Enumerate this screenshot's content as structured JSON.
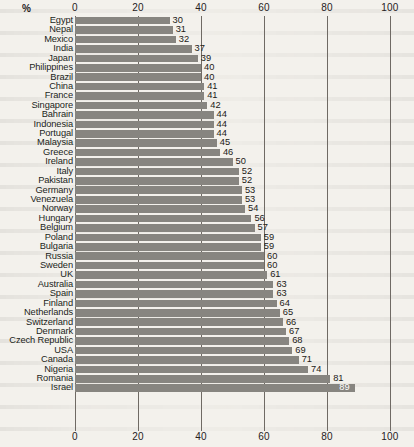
{
  "chart_data": {
    "type": "bar",
    "orientation": "horizontal",
    "title": "",
    "subtitle": "",
    "xlabel": "%",
    "ylabel": "",
    "xlim": [
      0,
      100
    ],
    "xticks": [
      0,
      20,
      40,
      60,
      80,
      100
    ],
    "xtick_labels": [
      "0",
      "20",
      "40",
      "60",
      "80",
      "100"
    ],
    "grid": true,
    "grid_axis": "x",
    "legend": false,
    "axis_positions": [
      "top",
      "bottom"
    ],
    "bar_color": "#878580",
    "background_color": "#f3f1ec",
    "text_color": "#221e1a",
    "value_labels_shown": true,
    "categories": [
      "Egypt",
      "Nepal",
      "Mexico",
      "India",
      "Japan",
      "Philippines",
      "Brazil",
      "China",
      "France",
      "Singapore",
      "Bahrain",
      "Indonesia",
      "Portugal",
      "Malaysia",
      "Greece",
      "Ireland",
      "Italy",
      "Pakistan",
      "Germany",
      "Venezuela",
      "Norway",
      "Hungary",
      "Belgium",
      "Poland",
      "Bulgaria",
      "Russia",
      "Sweden",
      "UK",
      "Australia",
      "Spain",
      "Finland",
      "Netherlands",
      "Switzerland",
      "Denmark",
      "Czech Republic",
      "USA",
      "Canada",
      "Nigeria",
      "Romania",
      "Israel"
    ],
    "values": [
      30,
      31,
      32,
      37,
      39,
      40,
      40,
      41,
      41,
      42,
      44,
      44,
      44,
      45,
      46,
      50,
      52,
      52,
      53,
      53,
      54,
      56,
      57,
      59,
      59,
      60,
      60,
      61,
      63,
      63,
      64,
      65,
      66,
      67,
      68,
      69,
      71,
      74,
      81,
      89
    ]
  }
}
